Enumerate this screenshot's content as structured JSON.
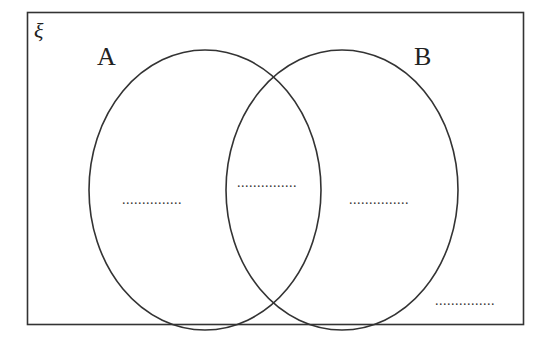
{
  "diagram": {
    "type": "venn",
    "universal_set_symbol": "ξ",
    "sets": [
      {
        "label": "A"
      },
      {
        "label": "B"
      }
    ],
    "regions": {
      "a_only": "...............",
      "a_and_b": "...............",
      "b_only": "...............",
      "outside": "..............."
    },
    "colors": {
      "stroke": "#333333",
      "background": "#ffffff"
    }
  }
}
